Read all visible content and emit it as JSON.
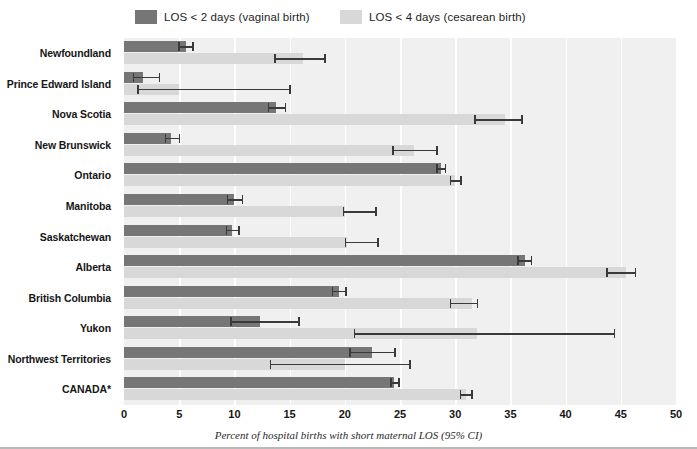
{
  "legend": {
    "items": [
      {
        "label": "LOS < 2 days (vaginal birth)",
        "color": "#767676",
        "key": "vaginal"
      },
      {
        "label": "LOS < 4 days (cesarean birth)",
        "color": "#d8d8d8",
        "key": "cesarean"
      }
    ]
  },
  "axis": {
    "x_ticks": [
      "0",
      "5",
      "10",
      "15",
      "20",
      "25",
      "30",
      "35",
      "40",
      "45",
      "50"
    ],
    "caption": "Percent of hospital births with short maternal LOS (95% CI)"
  },
  "colors": {
    "dark_bar": "#767676",
    "light_bar": "#d8d8d8",
    "plot_background": "#f0f0f0",
    "gridline": "#ffffff",
    "error_bar": "#3a3a3a",
    "text": "#161616"
  },
  "chart_data": {
    "type": "bar",
    "title": "",
    "subtitle": "",
    "xlabel": "Percent of hospital births with short maternal LOS (95% CI)",
    "ylabel": "",
    "xlim": [
      0,
      50
    ],
    "xticks": [
      0,
      5,
      10,
      15,
      20,
      25,
      30,
      35,
      40,
      45,
      50
    ],
    "grid": true,
    "orientation": "horizontal",
    "legend_position": "top",
    "categories": [
      "Newfoundland",
      "Prince Edward Island",
      "Nova Scotia",
      "New Brunswick",
      "Ontario",
      "Manitoba",
      "Saskatchewan",
      "Alberta",
      "British Columbia",
      "Yukon",
      "Northwest Territories",
      "CANADA*"
    ],
    "series": [
      {
        "name": "LOS < 2 days (vaginal birth)",
        "color": "#767676",
        "values": [
          5.6,
          1.7,
          13.8,
          4.3,
          28.7,
          10.0,
          9.8,
          36.3,
          19.5,
          12.3,
          22.5,
          24.5
        ],
        "ci_lower": [
          4.9,
          0.8,
          13.0,
          3.7,
          28.3,
          9.3,
          9.2,
          35.6,
          18.8,
          9.6,
          20.4,
          24.1
        ],
        "ci_upper": [
          6.3,
          3.3,
          14.7,
          5.1,
          29.2,
          10.8,
          10.5,
          37.0,
          20.2,
          15.9,
          24.6,
          25.0
        ]
      },
      {
        "name": "LOS < 4 days (cesarean birth)",
        "color": "#d8d8d8",
        "values": [
          16.2,
          5.0,
          34.5,
          26.3,
          30.0,
          20.0,
          20.2,
          45.5,
          31.5,
          32.0,
          20.0,
          31.0
        ],
        "ci_lower": [
          13.6,
          1.2,
          31.7,
          24.3,
          29.5,
          19.8,
          20.0,
          43.7,
          29.5,
          20.8,
          13.2,
          30.4
        ],
        "ci_upper": [
          18.3,
          15.1,
          36.1,
          28.4,
          30.6,
          22.9,
          23.1,
          46.4,
          32.1,
          44.5,
          26.0,
          31.6
        ]
      }
    ]
  }
}
